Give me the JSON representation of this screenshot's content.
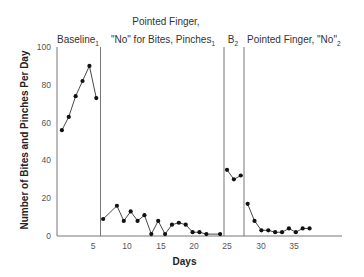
{
  "chart_data": {
    "type": "line",
    "title": "",
    "xlabel": "Days",
    "ylabel": "Number of Bites and Pinches Per Day",
    "ylim": [
      0,
      100
    ],
    "xlim": [
      0,
      42
    ],
    "yticks": [
      0,
      20,
      40,
      60,
      80,
      100
    ],
    "xticks": [
      5,
      10,
      15,
      20,
      25,
      30,
      35
    ],
    "grid": false,
    "legend": null,
    "phase_lines_after_day": [
      6.5,
      24.5,
      27.5
    ],
    "phases": [
      {
        "name": "Baseline",
        "subscript": "1",
        "lines": [
          "Baseline"
        ]
      },
      {
        "name": "Pointed Finger, \"No\" for Bites, Pinches",
        "subscript": "1",
        "lines": [
          "Pointed Finger,",
          "\"No\" for Bites, Pinches"
        ]
      },
      {
        "name": "B",
        "subscript": "2",
        "lines": [
          "B"
        ]
      },
      {
        "name": "Pointed Finger, \"No\"",
        "subscript": "2",
        "lines": [
          "Pointed Finger, \"No\""
        ]
      }
    ],
    "series": [
      {
        "name": "Baseline1",
        "x": [
          1,
          2,
          3,
          4,
          5,
          6
        ],
        "values": [
          56,
          63,
          74,
          82,
          90,
          73
        ]
      },
      {
        "name": "Pointed Finger, No for Bites, Pinches1",
        "x": [
          7,
          9,
          10,
          11,
          12,
          13,
          14,
          15,
          16,
          17,
          18,
          19,
          20,
          21,
          22,
          24
        ],
        "values": [
          9,
          16,
          8,
          13,
          8,
          11,
          1,
          8,
          1,
          6,
          7,
          6,
          2,
          2,
          1,
          1
        ]
      },
      {
        "name": "B2",
        "x": [
          25,
          26,
          27
        ],
        "values": [
          35,
          30,
          32
        ]
      },
      {
        "name": "Pointed Finger, No2",
        "x": [
          28,
          29,
          30,
          31,
          32,
          33,
          34,
          35,
          36,
          37
        ],
        "values": [
          17,
          8,
          3,
          3,
          2,
          2,
          4,
          2,
          4,
          4
        ]
      }
    ]
  }
}
